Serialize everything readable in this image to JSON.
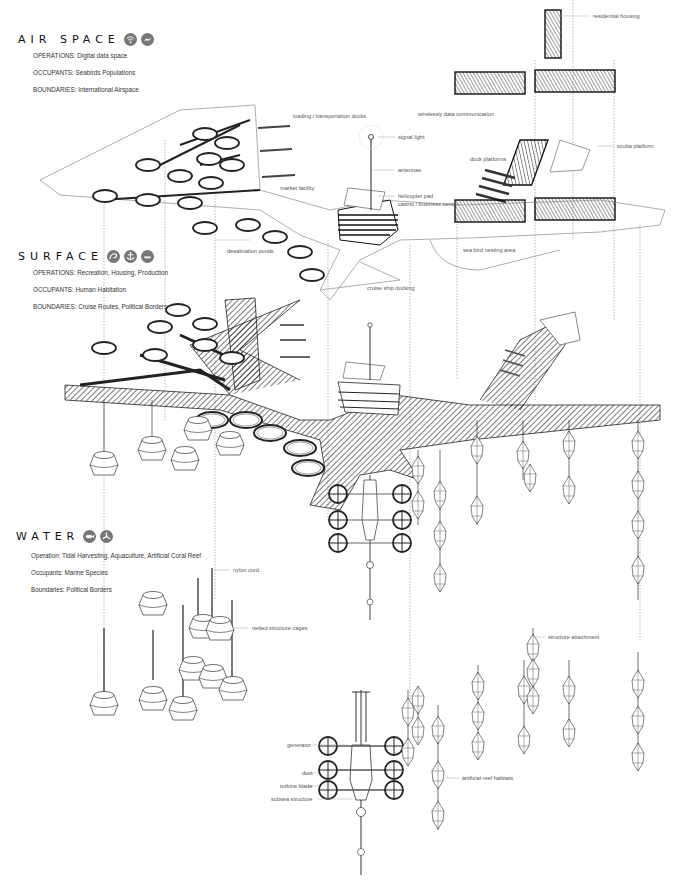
{
  "layers": {
    "air": {
      "title": "AIR SPACE",
      "icons": [
        "wifi-icon",
        "bird-icon"
      ],
      "operations": "OPERATIONS: Digital data space",
      "occupants": "OCCUPANTS:  Seabirds Populations",
      "boundaries": "BOUNDARIES: International Airspace"
    },
    "surface": {
      "title": "SURFACE",
      "icons": [
        "wave-icon",
        "anchor-icon",
        "boat-icon"
      ],
      "operations": "OPERATIONS: Recreation, Housing, Production",
      "occupants": "OCCUPANTS: Human Habitation",
      "boundaries": "BOUNDARIES: Cruise Routes, Political Borders"
    },
    "water": {
      "title": "WATER",
      "icons": [
        "fish-icon",
        "turbine-icon"
      ],
      "operations": "Operation: Tidal Harvesting, Aquaculture, Artificial Coral Reef",
      "occupants": "Occupants: Marine Species",
      "boundaries": "Boundaries: Political Borders"
    }
  },
  "annotations": {
    "residential_housing": "residential housing",
    "loading_docks": "loading / transportation docks",
    "wireless_data": "wirelessly data communication",
    "signal_light": "signal light",
    "antennae": "antennae",
    "dock_platforms": "dock platforms",
    "scuba_platform": "scuba platform",
    "market_facility": "market facility",
    "helicopter_pad": "helicopter pad",
    "casino_business": "casino / business center",
    "desalination_ponds": "desalination ponds",
    "sea_bird_nesting": "sea bird nesting area",
    "cruise_ship_docking": "cruise ship docking",
    "nylon_cord": "nylon cord",
    "netted_cages": "netted structure cages",
    "structure_attachment": "structure attachment",
    "generator": "generator",
    "duct": "duct",
    "turbine_blade": "turbine blade",
    "subsea_structure": "subsea structure",
    "artificial_reef": "artificial reef habitats"
  },
  "colors": {
    "ink": "#1a1a1a",
    "label": "#555555",
    "icon_bg": "#777777",
    "guide": "#888888"
  }
}
